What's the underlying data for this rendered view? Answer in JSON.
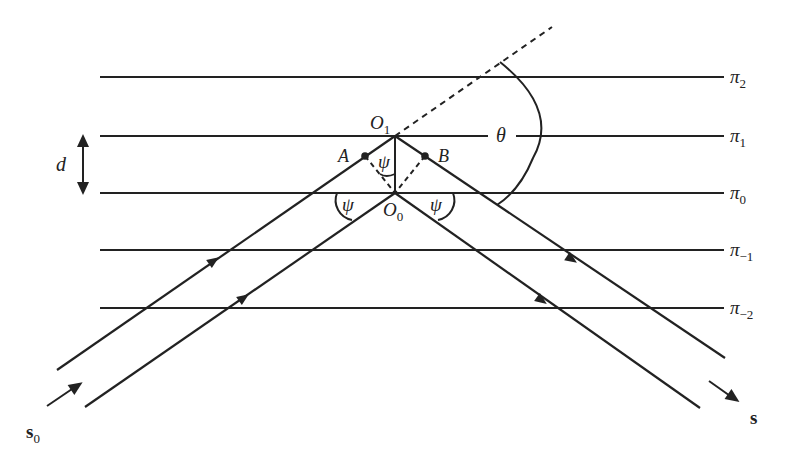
{
  "planes": [
    {
      "label": "π",
      "sub": "2",
      "y": 77
    },
    {
      "label": "π",
      "sub": "1",
      "y": 136
    },
    {
      "label": "π",
      "sub": "0",
      "y": 193
    },
    {
      "label": "π",
      "sub": "−1",
      "y": 250
    },
    {
      "label": "π",
      "sub": "−2",
      "y": 308
    }
  ],
  "points": {
    "O1": {
      "label": "O",
      "sub": "1"
    },
    "O0": {
      "label": "O",
      "sub": "0"
    },
    "A": {
      "label": "A"
    },
    "B": {
      "label": "B"
    }
  },
  "angles": {
    "psi": "ψ",
    "theta": "θ"
  },
  "spacing_label": "d",
  "vectors": {
    "incident": {
      "label": "s",
      "sub": "0"
    },
    "scattered": {
      "label": "s"
    }
  },
  "colors": {
    "line": "#222222",
    "background": "#ffffff"
  }
}
